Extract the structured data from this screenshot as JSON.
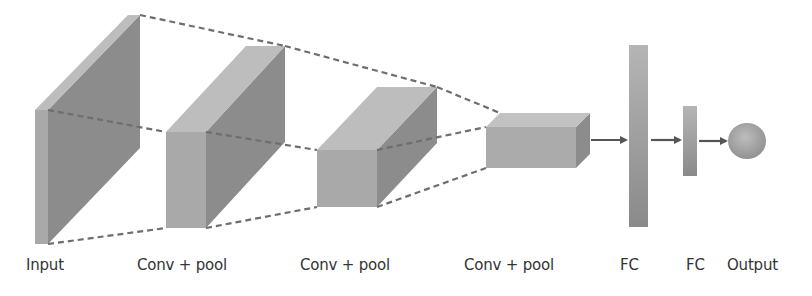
{
  "layers": [
    {
      "id": "input",
      "label": "Input",
      "type": "feature-map"
    },
    {
      "id": "conv1",
      "label": "Conv + pool",
      "type": "feature-map"
    },
    {
      "id": "conv2",
      "label": "Conv + pool",
      "type": "feature-map"
    },
    {
      "id": "conv3",
      "label": "Conv + pool",
      "type": "feature-map"
    },
    {
      "id": "fc1",
      "label": "FC",
      "type": "dense"
    },
    {
      "id": "fc2",
      "label": "FC",
      "type": "dense"
    },
    {
      "id": "output",
      "label": "Output",
      "type": "node"
    }
  ],
  "colors": {
    "front": "#a9a9a9",
    "top": "#bdbdbd",
    "side": "#8c8c8c",
    "dash": "#6e6e6e",
    "arrow": "#555555",
    "text": "#333333"
  }
}
